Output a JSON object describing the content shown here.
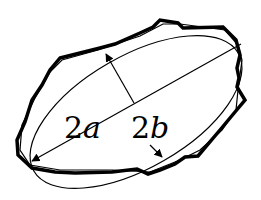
{
  "diagram": {
    "colors": {
      "stroke": "#000000",
      "background": "#ffffff"
    },
    "labels": {
      "major_axis": {
        "num": "2",
        "var": "a"
      },
      "minor_axis": {
        "num": "2",
        "var": "b"
      }
    },
    "shapes": {
      "particle_outline": "irregular-polygon",
      "fitted_ellipse": "ellipse",
      "major_axis_line": "arrow-line",
      "minor_axis_line": "arrow-line"
    }
  }
}
